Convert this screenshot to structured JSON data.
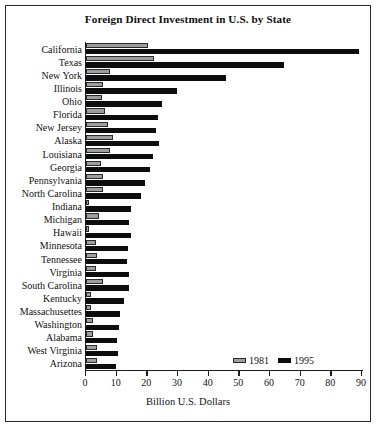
{
  "chart_data": {
    "type": "bar",
    "orientation": "horizontal",
    "title": "Foreign Direct Investment in U.S. by State",
    "xlabel": "Billion U.S. Dollars",
    "ylabel": "",
    "xlim": [
      0,
      90
    ],
    "xticks": [
      0,
      10,
      20,
      30,
      40,
      50,
      60,
      70,
      80,
      90
    ],
    "grid": false,
    "legend_position": "bottom-right",
    "categories": [
      "California",
      "Texas",
      "New York",
      "Illinois",
      "Ohio",
      "Florida",
      "New Jersey",
      "Alaska",
      "Louisiana",
      "Georgia",
      "Pennsylvania",
      "North Carolina",
      "Indiana",
      "Michigan",
      "Hawaii",
      "Minnesota",
      "Tennessee",
      "Virginia",
      "South Carolina",
      "Kentucky",
      "Massachusettes",
      "Washington",
      "Alabama",
      "West Virginia",
      "Arizona"
    ],
    "series": [
      {
        "name": "1981",
        "color": "#9d9d9d",
        "values": [
          20.2,
          22.3,
          7.8,
          5.4,
          5.1,
          6.2,
          7.2,
          8.7,
          7.8,
          4.9,
          5.4,
          5.4,
          0.9,
          4.1,
          0.9,
          3.3,
          3.5,
          3.1,
          5.4,
          1.5,
          1.5,
          2.3,
          2.4,
          3.6,
          3.6
        ]
      },
      {
        "name": "1995",
        "color": "#0d0d0d",
        "values": [
          89.1,
          64.6,
          45.5,
          29.6,
          24.8,
          23.5,
          22.7,
          23.9,
          21.7,
          20.9,
          19.2,
          18.0,
          14.6,
          14.0,
          14.6,
          13.8,
          13.4,
          13.9,
          13.9,
          12.3,
          11.0,
          10.8,
          10.0,
          10.5,
          9.8
        ]
      }
    ]
  }
}
